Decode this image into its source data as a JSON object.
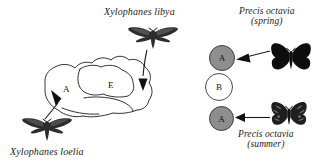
{
  "figure": {
    "background_color": "#ffffff",
    "ink_color": "#1a1a1a"
  },
  "left_panel": {
    "name": "hawkmoth-range-map-panel",
    "map": {
      "name": "hand-drawn-range-outline",
      "region_labels": [
        {
          "id": "A",
          "label": "A",
          "x": 66,
          "y": 89
        },
        {
          "id": "E",
          "label": "E",
          "x": 110,
          "y": 85
        }
      ]
    },
    "specimens": [
      {
        "id": "xylophanes-libya",
        "caption": "Xylophanes libya",
        "caption_x": 104,
        "caption_y": 8,
        "kind": "moth",
        "fill": "#2b2b2b",
        "x": 127,
        "y": 26,
        "width": 52,
        "height": 24
      },
      {
        "id": "xylophanes-loelia",
        "caption": "Xylophanes loelia",
        "caption_x": 10,
        "caption_y": 148,
        "kind": "moth",
        "fill": "#2b2b2b",
        "x": 21,
        "y": 116,
        "width": 52,
        "height": 26
      }
    ]
  },
  "right_panel": {
    "name": "precis-octavia-seasonal-forms-panel",
    "nodes": [
      {
        "id": "node-a-spring",
        "label": "A",
        "type": "filled",
        "color": "#8e8e8e",
        "x": 209,
        "y": 45,
        "size": 26
      },
      {
        "id": "node-b",
        "label": "B",
        "type": "open",
        "color": "#ffffff",
        "x": 205,
        "y": 73,
        "size": 28
      },
      {
        "id": "node-a-summer",
        "label": "A",
        "type": "filled",
        "color": "#8e8e8e",
        "x": 209,
        "y": 106,
        "size": 25
      }
    ],
    "specimens": [
      {
        "id": "precis-octavia-spring",
        "caption_line1": "Precis octavia",
        "caption_line2": "(spring)",
        "caption_x": 239,
        "caption_y": 8,
        "kind": "butterfly",
        "pattern": "solid-black",
        "fill": "#0d0d0d",
        "x": 270,
        "y": 42,
        "width": 42,
        "height": 34
      },
      {
        "id": "precis-octavia-summer",
        "caption_line1": "Precis octavia",
        "caption_line2": "(summer)",
        "caption_x": 238,
        "caption_y": 131,
        "kind": "butterfly",
        "pattern": "mottled-dark",
        "fill": "#1c1c1c",
        "x": 270,
        "y": 101,
        "width": 38,
        "height": 29
      }
    ]
  }
}
